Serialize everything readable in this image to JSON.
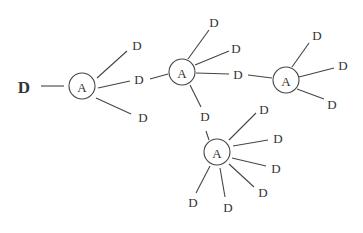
{
  "diagram": {
    "type": "tree",
    "root": {
      "label": "D",
      "x": 24,
      "y": 87,
      "size": 17,
      "bold": true
    },
    "a_nodes": [
      {
        "id": "A1",
        "label": "A",
        "x": 82,
        "y": 86,
        "r": 13
      },
      {
        "id": "A2",
        "label": "A",
        "x": 182,
        "y": 72,
        "r": 13
      },
      {
        "id": "A3",
        "label": "A",
        "x": 286,
        "y": 80,
        "r": 13
      },
      {
        "id": "A4",
        "label": "A",
        "x": 217,
        "y": 152,
        "r": 13
      }
    ],
    "d_nodes": [
      {
        "id": "D1",
        "label": "D",
        "x": 137,
        "y": 45
      },
      {
        "id": "D2",
        "label": "D",
        "x": 139,
        "y": 79
      },
      {
        "id": "D3",
        "label": "D",
        "x": 143,
        "y": 117
      },
      {
        "id": "D4",
        "label": "D",
        "x": 214,
        "y": 22
      },
      {
        "id": "D5",
        "label": "D",
        "x": 236,
        "y": 48
      },
      {
        "id": "D6",
        "label": "D",
        "x": 238,
        "y": 74
      },
      {
        "id": "D7",
        "label": "D",
        "x": 317,
        "y": 35
      },
      {
        "id": "D8",
        "label": "D",
        "x": 343,
        "y": 65
      },
      {
        "id": "D9",
        "label": "D",
        "x": 332,
        "y": 104
      },
      {
        "id": "D10",
        "label": "D",
        "x": 205,
        "y": 116
      },
      {
        "id": "D11",
        "label": "D",
        "x": 264,
        "y": 109
      },
      {
        "id": "D12",
        "label": "D",
        "x": 278,
        "y": 138
      },
      {
        "id": "D13",
        "label": "D",
        "x": 276,
        "y": 168
      },
      {
        "id": "D14",
        "label": "D",
        "x": 263,
        "y": 192
      },
      {
        "id": "D15",
        "label": "D",
        "x": 228,
        "y": 207
      },
      {
        "id": "D16",
        "label": "D",
        "x": 193,
        "y": 202
      }
    ],
    "edges": [
      [
        41,
        86,
        64,
        86
      ],
      [
        97,
        78,
        127,
        51
      ],
      [
        98,
        88,
        130,
        81
      ],
      [
        96,
        98,
        131,
        114
      ],
      [
        150,
        79,
        168,
        74
      ],
      [
        188,
        59,
        209,
        30
      ],
      [
        195,
        65,
        229,
        51
      ],
      [
        196,
        73,
        229,
        74
      ],
      [
        190,
        85,
        201,
        107
      ],
      [
        248,
        75,
        272,
        78
      ],
      [
        292,
        67,
        309,
        43
      ],
      [
        299,
        77,
        334,
        68
      ],
      [
        297,
        89,
        324,
        99
      ],
      [
        209,
        140,
        206,
        131
      ],
      [
        229,
        140,
        256,
        113
      ],
      [
        233,
        146,
        268,
        140
      ],
      [
        232,
        158,
        266,
        166
      ],
      [
        229,
        164,
        254,
        187
      ],
      [
        220,
        168,
        225,
        197
      ],
      [
        210,
        166,
        196,
        193
      ]
    ]
  }
}
